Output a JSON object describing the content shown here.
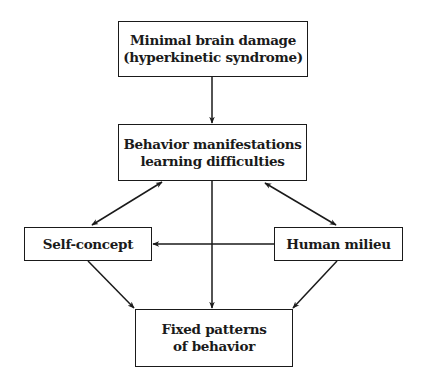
{
  "diagram": {
    "type": "flowchart",
    "nodes": {
      "minimal_brain_damage": {
        "lines": [
          "Minimal brain damage",
          "(hyperkinetic syndrome)"
        ]
      },
      "behavior_manifestations": {
        "lines": [
          "Behavior manifestations",
          "learning difficulties"
        ]
      },
      "self_concept": {
        "lines": [
          "Self-concept"
        ]
      },
      "human_milieu": {
        "lines": [
          "Human milieu"
        ]
      },
      "fixed_patterns": {
        "lines": [
          "Fixed patterns",
          "of behavior"
        ]
      }
    },
    "edges": [
      {
        "from": "Minimal brain damage (hyperkinetic syndrome)",
        "to": "Behavior manifestations learning difficulties",
        "direction": "one-way"
      },
      {
        "from": "Behavior manifestations learning difficulties",
        "to": "Self-concept",
        "direction": "two-way"
      },
      {
        "from": "Behavior manifestations learning difficulties",
        "to": "Human milieu",
        "direction": "two-way"
      },
      {
        "from": "Human milieu",
        "to": "Self-concept",
        "direction": "one-way"
      },
      {
        "from": "Behavior manifestations learning difficulties",
        "to": "Fixed patterns of behavior",
        "direction": "one-way"
      },
      {
        "from": "Self-concept",
        "to": "Fixed patterns of behavior",
        "direction": "one-way"
      },
      {
        "from": "Human milieu",
        "to": "Fixed patterns of behavior",
        "direction": "one-way"
      }
    ],
    "colors": {
      "stroke": "#1a1a1a",
      "background": "#ffffff"
    }
  }
}
